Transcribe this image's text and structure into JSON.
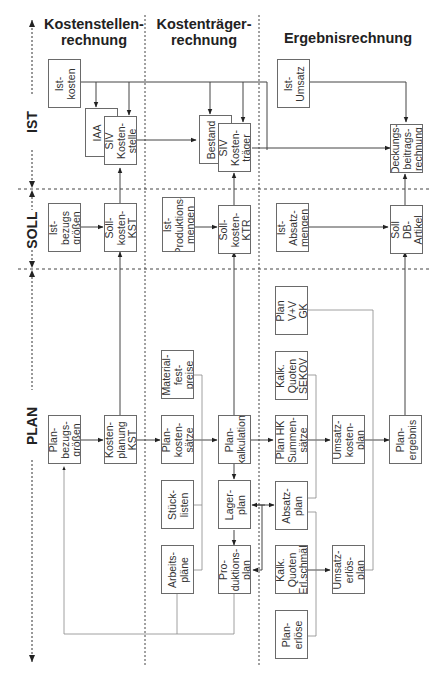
{
  "columns": [
    {
      "id": "kst",
      "title": "Kostenstellen-\nrechnung"
    },
    {
      "id": "ktr",
      "title": "Kostenträger-\nrechnung"
    },
    {
      "id": "erg",
      "title": "Ergebnisrechnung"
    }
  ],
  "rows": [
    {
      "id": "ist",
      "label": "IST"
    },
    {
      "id": "soll",
      "label": "SOLL"
    },
    {
      "id": "plan",
      "label": "PLAN"
    }
  ],
  "boxes": {
    "ist_kosten": "Ist-\nkosten",
    "iaa": "IAA",
    "siv_kostenstelle": "SIV\nKosten-\nstelle",
    "bestand": "Bestand",
    "siv_kostentraeger": "SIV\nKosten-\nträger",
    "ist_umsatz": "Ist-\nUmsatz",
    "deckungsbeitragsrechnung": "Deckungs-\nbeitrags-\nrechnung",
    "ist_bezugsgroessen": "Ist-\nbezugs\ngrößen",
    "soll_kosten_kst": "Soll-\nkosten-\nKST",
    "ist_produktionsmengen": "Ist-\nProduktions-\nmengen",
    "soll_kosten_ktr": "Soll-\nkosten-\nKTR",
    "ist_absatzmengen": "Ist-\nAbsatz-\nmengen",
    "soll_db_artikel": "Soll\nDB-\nArtikel",
    "plan_v_v_gk": "Plan\nV+V\nGK",
    "materialfestpreise": "Material-\nfest-\npreise",
    "kalk_quoten_sekov": "Kalk.\nQuoten\nSEKOV",
    "plan_bezugsgroessen": "Plan-\nbezugs-\ngrößen",
    "kostenplanung_kst": "Kosten-\nplanung\nKST",
    "plankostensaetze": "Plan-\nkosten-\nsätze",
    "plankalkulation": "Plan-\nkalkulation",
    "plan_hk_summensaetze": "Plan HK\nSummen-\nsätze",
    "umsatzkostenplan": "Umsatz-\nkosten-\nplan",
    "planergebnis": "Plan-\nergebnis",
    "stuecklisten": "Stück-\nlisten",
    "lagerplan": "Lager-\nplan",
    "absatzplan": "Absatz-\nplan",
    "arbeitsplaene": "Arbeits-\npläne",
    "produktionsplan": "Pro-\nduktions-\nplan",
    "kalk_quoten_erl_schmael": "Kalk.\nQuoten\nErl.schmäl",
    "umsatzerloesplan": "Umsatz-\nerlös-\nplan",
    "planerloese": "Plan-\nerlöse"
  }
}
